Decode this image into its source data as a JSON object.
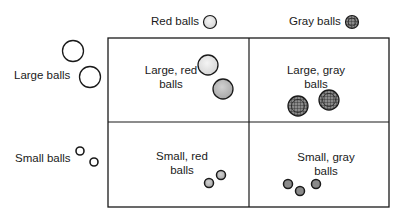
{
  "column_headers": [
    {
      "label": "Red balls",
      "icon": "red-ball-icon"
    },
    {
      "label": "Gray balls",
      "icon": "gray-ball-icon"
    }
  ],
  "row_headers": [
    {
      "label": "Large balls",
      "icon": "large-ball-icon"
    },
    {
      "label": "Small balls",
      "icon": "small-ball-icon"
    }
  ],
  "cells": [
    {
      "row": 0,
      "col": 0,
      "label": "Large, red\nballs",
      "count": 2
    },
    {
      "row": 0,
      "col": 1,
      "label": "Large, gray\nballs",
      "count": 2
    },
    {
      "row": 1,
      "col": 0,
      "label": "Small, red\nballs",
      "count": 2
    },
    {
      "row": 1,
      "col": 1,
      "label": "Small, gray\nballs",
      "count": 3
    }
  ],
  "colors": {
    "line": "#1a1a1a",
    "red_ball_fill": "#e6e6e6",
    "red_ball_fill_dark": "#c4c4c4",
    "gray_ball_fill": "#9a9a9a"
  }
}
